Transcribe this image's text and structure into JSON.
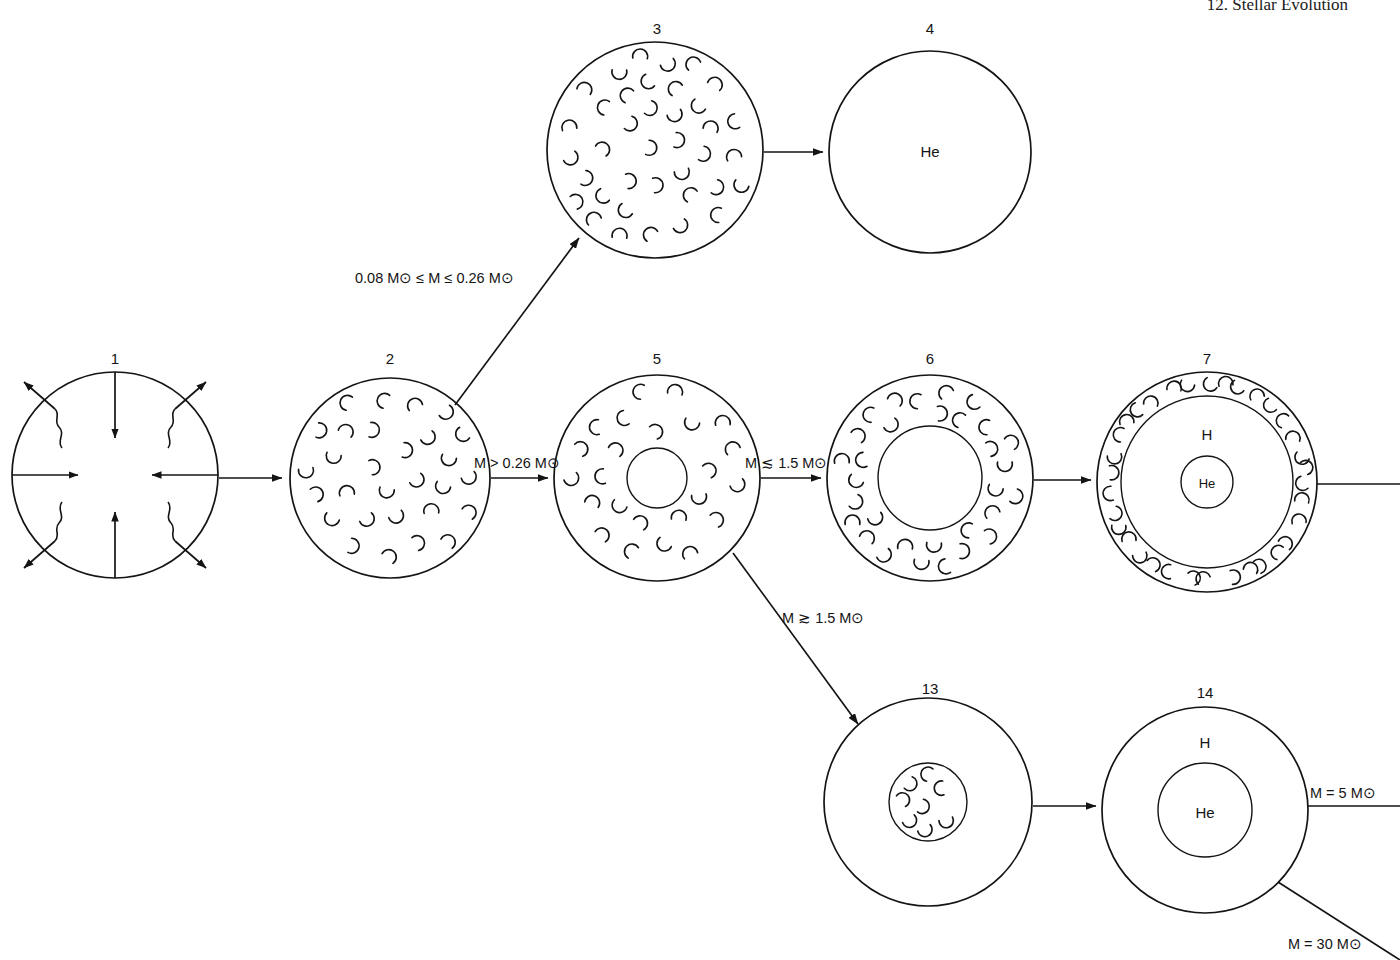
{
  "page": {
    "running_head": "12. Stellar Evolution",
    "width": 1400,
    "height": 960,
    "line_color": "#141414",
    "background": "#ffffff"
  },
  "stages": [
    {
      "id": "1",
      "number": "1",
      "name": "protostar-collapsing-cloud",
      "cx": 115,
      "cy": 475,
      "r": 103,
      "label_x": 115,
      "label_y": 358,
      "inner_labels": [],
      "rings": [],
      "arrows_in": 4,
      "wavy_out": 4
    },
    {
      "id": "2",
      "number": "2",
      "name": "fully-convective-star",
      "cx": 390,
      "cy": 478,
      "r": 100,
      "label_x": 390,
      "label_y": 358,
      "inner_labels": [],
      "rings": [],
      "convection": "full"
    },
    {
      "id": "3",
      "number": "3",
      "name": "fully-convective-low-mass-star",
      "cx": 655,
      "cy": 150,
      "r": 108,
      "label_x": 657,
      "label_y": 30,
      "inner_labels": [],
      "rings": [],
      "convection": "full"
    },
    {
      "id": "4",
      "number": "4",
      "name": "helium-white-dwarf",
      "cx": 930,
      "cy": 152,
      "r": 101,
      "label_x": 930,
      "label_y": 30,
      "inner_labels": [
        {
          "text": "He",
          "dx": 0,
          "dy": 5,
          "size": "normal"
        }
      ],
      "rings": [],
      "convection": "none"
    },
    {
      "id": "5",
      "number": "5",
      "name": "star-with-small-radiative-core",
      "cx": 657,
      "cy": 478,
      "r": 103,
      "label_x": 657,
      "label_y": 358,
      "inner_labels": [],
      "rings": [
        30
      ],
      "convection": "annulus"
    },
    {
      "id": "6",
      "number": "6",
      "name": "star-with-large-radiative-core",
      "cx": 930,
      "cy": 478,
      "r": 103,
      "label_x": 930,
      "label_y": 358,
      "inner_labels": [],
      "rings": [
        52
      ],
      "convection": "annulus"
    },
    {
      "id": "7",
      "number": "7",
      "name": "red-giant-hydrogen-shell-helium-core",
      "cx": 1207,
      "cy": 482,
      "r": 110,
      "label_x": 1207,
      "label_y": 360,
      "inner_labels": [
        {
          "text": "H",
          "dx": 0,
          "dy": -42,
          "size": "normal"
        },
        {
          "text": "He",
          "dx": 0,
          "dy": 6,
          "size": "small"
        }
      ],
      "rings": [
        86,
        26
      ],
      "convection": "thin-shell"
    },
    {
      "id": "13",
      "number": "13",
      "name": "massive-star-convective-core",
      "cx": 928,
      "cy": 802,
      "r": 104,
      "label_x": 930,
      "label_y": 690,
      "inner_labels": [],
      "rings": [
        39
      ],
      "convection": "core"
    },
    {
      "id": "14",
      "number": "14",
      "name": "massive-star-hydrogen-envelope-helium-core",
      "cx": 1205,
      "cy": 810,
      "r": 103,
      "label_x": 1205,
      "label_y": 694,
      "inner_labels": [
        {
          "text": "H",
          "dx": 0,
          "dy": -62,
          "size": "normal"
        },
        {
          "text": "He",
          "dx": 0,
          "dy": 8,
          "size": "normal"
        }
      ],
      "rings": [
        47
      ],
      "convection": "none"
    }
  ],
  "transitions": [
    {
      "name": "transition-1-to-2",
      "from": "1",
      "to": "2",
      "kind": "arrow-horizontal",
      "label": null
    },
    {
      "name": "transition-2-to-3",
      "from": "2",
      "to": "3",
      "kind": "arrow-diagonal-up",
      "label": "0.08 M⊙ ≤ M ≤ 0.26 M⊙",
      "label_x": 355,
      "label_y": 283
    },
    {
      "name": "transition-3-to-4",
      "from": "3",
      "to": "4",
      "kind": "arrow-horizontal",
      "label": null
    },
    {
      "name": "transition-2-to-5",
      "from": "2",
      "to": "5",
      "kind": "arrow-horizontal",
      "label": "M > 0.26 M⊙",
      "label_x": 474,
      "label_y": 468
    },
    {
      "name": "transition-5-to-6",
      "from": "5",
      "to": "6",
      "kind": "arrow-horizontal",
      "label": "M ≲ 1.5 M⊙",
      "label_x": 745,
      "label_y": 468
    },
    {
      "name": "transition-6-to-7",
      "from": "6",
      "to": "7",
      "kind": "arrow-horizontal",
      "label": null
    },
    {
      "name": "transition-5-to-13",
      "from": "5",
      "to": "13",
      "kind": "arrow-diagonal-down",
      "label": "M ≳ 1.5 M⊙",
      "label_x": 782,
      "label_y": 623
    },
    {
      "name": "transition-13-to-14",
      "from": "13",
      "to": "14",
      "kind": "arrow-horizontal",
      "label": null
    },
    {
      "name": "exit-7-right",
      "from": "7",
      "to": "offpage",
      "kind": "line-horizontal",
      "label": null
    },
    {
      "name": "exit-14-right-5msun",
      "from": "14",
      "to": "offpage",
      "kind": "line-horizontal",
      "label": "M = 5 M⊙",
      "label_x": 1310,
      "label_y": 798
    },
    {
      "name": "exit-14-diagonal-30msun",
      "from": "14",
      "to": "offpage",
      "kind": "line-diagonal-down",
      "label": "M = 30 M⊙",
      "label_x": 1288,
      "label_y": 949
    }
  ],
  "sun_symbol": {
    "name": "solar-mass-symbol",
    "glyph": "⊙",
    "description": "circled dot denoting solar mass"
  }
}
